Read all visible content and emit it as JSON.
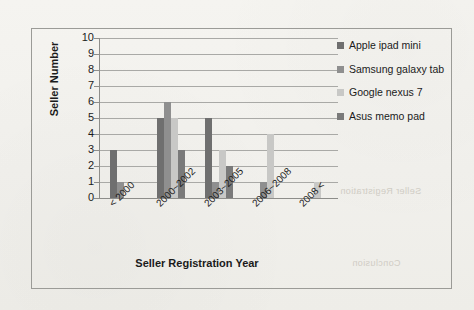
{
  "chart_data": {
    "type": "bar",
    "title": "",
    "xlabel": "Seller Registration Year",
    "ylabel": "Seller Number",
    "categories": [
      "< 2000",
      "2000~2002",
      "2003~2005",
      "2006~2008",
      "2008 <"
    ],
    "ylim": [
      0,
      10
    ],
    "yticks": [
      0,
      1,
      2,
      3,
      4,
      5,
      6,
      7,
      8,
      9,
      10
    ],
    "grid": true,
    "legend_position": "right",
    "series": [
      {
        "name": "Apple ipad mini",
        "color": "#6f6f6f",
        "values": [
          3,
          5,
          5,
          0,
          0
        ]
      },
      {
        "name": "Samsung galaxy tab",
        "color": "#8f8f8f",
        "values": [
          1,
          6,
          1,
          1,
          0
        ]
      },
      {
        "name": "Google nexus 7",
        "color": "#c8c8c6",
        "values": [
          0,
          5,
          3,
          4,
          1
        ]
      },
      {
        "name": "Asus memo pad",
        "color": "#7a7a7a",
        "values": [
          0,
          3,
          2,
          0,
          0
        ]
      }
    ]
  },
  "legend": {
    "entries": [
      "Apple ipad mini",
      "Samsung galaxy tab",
      "Google nexus 7",
      "Asus memo pad"
    ]
  },
  "background_artifacts": {
    "bleed_1": "Conclusion",
    "bleed_2": "Seller Registration"
  }
}
